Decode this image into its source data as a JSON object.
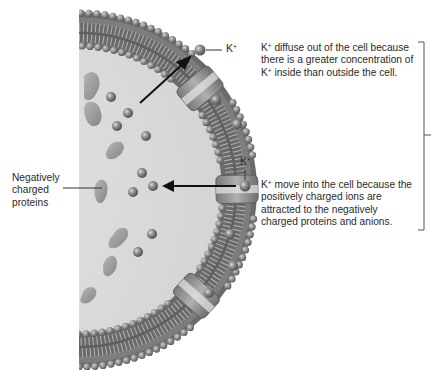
{
  "figure": {
    "labels": {
      "negatively_charged_proteins": [
        "Negatively",
        "charged",
        "proteins"
      ],
      "k_ion_top": {
        "base": "K",
        "sup": "+"
      },
      "k_ion_right": {
        "base": "K",
        "sup": "+"
      },
      "diffuse_out": {
        "lines": [
          {
            "k": "K",
            "sup": "+",
            "text": " diffuse out of the cell because"
          },
          {
            "text": "there is a greater concentration of"
          },
          {
            "k": "K",
            "sup": "+",
            "text": " inside than outside the cell."
          }
        ]
      },
      "move_in": {
        "lines": [
          {
            "k": "K",
            "sup": "+",
            "text": " move into the cell because the"
          },
          {
            "text": "positively charged ions are"
          },
          {
            "text": "attracted to the negatively"
          },
          {
            "text": "charged proteins and anions."
          }
        ]
      }
    },
    "arrows": [
      {
        "name": "efflux-arrow",
        "direction": "out"
      },
      {
        "name": "influx-arrow",
        "direction": "in"
      }
    ],
    "colors": {
      "membrane_dark": "#5f5f5f",
      "membrane_mid": "#8a8a8a",
      "head": "#8c8c8c",
      "cytoplasm": "#dedede",
      "protein": "#9a9a9a",
      "ion": "#7a7a7a",
      "text": "#2a2a2a"
    }
  }
}
